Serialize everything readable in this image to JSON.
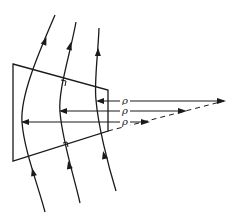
{
  "diagram": {
    "field_lines": [
      {
        "name": "field-line-outer",
        "direction": "upward"
      },
      {
        "name": "field-line-middle",
        "direction": "upward"
      },
      {
        "name": "field-line-inner",
        "direction": "upward"
      }
    ],
    "radius_arrows": [
      {
        "label": "ρ"
      },
      {
        "label": "ρ"
      },
      {
        "label": "ρ"
      }
    ],
    "right_angle_markers": 2,
    "colors": {
      "line": "#1a1a1a",
      "background": "#ffffff"
    }
  }
}
